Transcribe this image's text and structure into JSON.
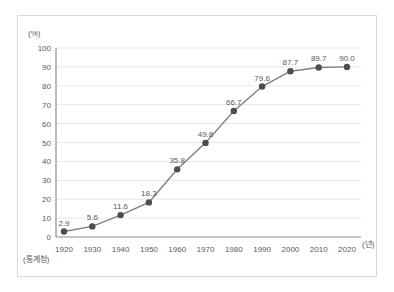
{
  "colors": {
    "line": "#7f7f7f",
    "marker": "#4d4d4d",
    "value_label": "#595959",
    "tick_label": "#595959",
    "grid": "#e8e8e8",
    "axis": "#8c8c8c",
    "panel_border": "#d9d9d9",
    "background": "#ffffff"
  },
  "chart_data": {
    "type": "line",
    "x": [
      1920,
      1930,
      1940,
      1950,
      1960,
      1970,
      1980,
      1990,
      2000,
      2010,
      2020
    ],
    "values": [
      2.9,
      5.6,
      11.6,
      18.3,
      35.8,
      49.8,
      66.7,
      79.6,
      87.7,
      89.7,
      90.0
    ],
    "title": "",
    "xlabel": "(년)",
    "ylabel": "(%)",
    "source": "(통계청)",
    "ylim": [
      0,
      100
    ],
    "ytick_step": 10,
    "grid": true,
    "legend": "none",
    "marker": "circle",
    "value_labels_shown": true
  }
}
